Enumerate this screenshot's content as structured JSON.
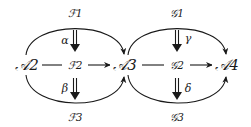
{
  "nodes": {
    "a2": "𝒜2",
    "f2": "ℱ2",
    "a3": "𝒜3",
    "g2": "𝒢2",
    "a4": "𝒜4"
  },
  "arc_labels": {
    "f1": "ℱ1",
    "f3": "ℱ3",
    "g1": "𝒢1",
    "g3": "𝒢3"
  },
  "two_cells": {
    "alpha": "α",
    "beta": "β",
    "gamma": "γ",
    "delta": "δ"
  },
  "colors": {
    "ink": "#1a1a1a",
    "background": "#ffffff"
  }
}
